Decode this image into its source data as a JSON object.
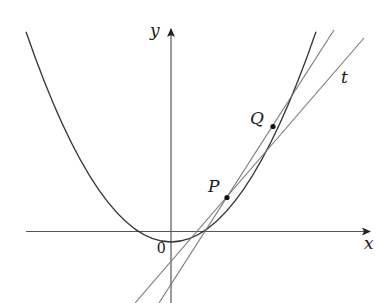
{
  "diagram": {
    "type": "parabola-secant-tangent",
    "axes": {
      "x_label": "x",
      "y_label": "y",
      "origin_label": "0"
    },
    "curve": {
      "name": "parabola",
      "equation_hint": "y = x^2"
    },
    "points": [
      {
        "id": "P",
        "label": "P"
      },
      {
        "id": "Q",
        "label": "Q"
      }
    ],
    "lines": [
      {
        "id": "secant",
        "description": "secant line through P and Q"
      },
      {
        "id": "tangent",
        "description": "tangent line at P",
        "label": "t"
      }
    ],
    "colors": {
      "curve": "#333333",
      "axes": "#555555",
      "lines": "#777777",
      "points": "#111111"
    }
  }
}
